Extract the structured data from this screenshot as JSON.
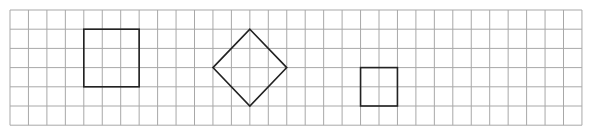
{
  "diagram": {
    "grid": {
      "x0": 10,
      "y0": 10,
      "cols": 31,
      "rows": 6,
      "cell_w": 18.45,
      "cell_h": 19.2,
      "color": "#a8a8a8"
    },
    "shapes": [
      {
        "type": "square",
        "label": "large-square",
        "cells": [
          4,
          1
        ],
        "size_cells": 3,
        "color": "#222222"
      },
      {
        "type": "diamond",
        "label": "rotated-square",
        "center_cells": [
          13,
          3
        ],
        "radius_cells": 2,
        "color": "#222222"
      },
      {
        "type": "square",
        "label": "small-square",
        "cells": [
          19,
          3
        ],
        "size_cells": 2,
        "color": "#222222"
      }
    ]
  }
}
